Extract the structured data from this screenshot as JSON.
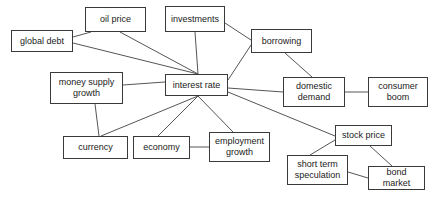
{
  "diagram": {
    "type": "node-link-diagram",
    "style": {
      "background": "#ffffff",
      "node_fill": "#ffffff",
      "node_stroke": "#3a3a3a",
      "edge_stroke": "#555555",
      "text_color": "#1a1a1a"
    },
    "nodes": [
      {
        "id": "global-debt",
        "label": "global debt",
        "x": 11,
        "y": 30,
        "w": 62,
        "h": 22
      },
      {
        "id": "oil-price",
        "label": "oil price",
        "x": 85,
        "y": 7,
        "w": 61,
        "h": 25
      },
      {
        "id": "investments",
        "label": "investments",
        "x": 165,
        "y": 6,
        "w": 60,
        "h": 26
      },
      {
        "id": "borrowing",
        "label": "borrowing",
        "x": 251,
        "y": 29,
        "w": 61,
        "h": 24
      },
      {
        "id": "money-supply-growth",
        "label": "money supply\ngrowth",
        "x": 50,
        "y": 72,
        "w": 73,
        "h": 32
      },
      {
        "id": "interest-rate",
        "label": "interest rate",
        "x": 165,
        "y": 74,
        "w": 63,
        "h": 22
      },
      {
        "id": "domestic-demand",
        "label": "domestic\ndemand",
        "x": 283,
        "y": 77,
        "w": 62,
        "h": 30
      },
      {
        "id": "consumer-boom",
        "label": "consumer\nboom",
        "x": 368,
        "y": 77,
        "w": 60,
        "h": 30
      },
      {
        "id": "currency",
        "label": "currency",
        "x": 63,
        "y": 136,
        "w": 65,
        "h": 23
      },
      {
        "id": "economy",
        "label": "economy",
        "x": 133,
        "y": 136,
        "w": 57,
        "h": 23
      },
      {
        "id": "employment-growth",
        "label": "employment\ngrowth",
        "x": 209,
        "y": 132,
        "w": 61,
        "h": 30
      },
      {
        "id": "stock-price",
        "label": "stock price",
        "x": 335,
        "y": 125,
        "w": 57,
        "h": 21
      },
      {
        "id": "short-term-speculation",
        "label": "short term\nspeculation",
        "x": 287,
        "y": 155,
        "w": 61,
        "h": 30
      },
      {
        "id": "bond-market",
        "label": "bond\nmarket",
        "x": 368,
        "y": 166,
        "w": 57,
        "h": 24
      }
    ],
    "edges": [
      {
        "from": "global-debt",
        "to": "oil-price",
        "x1": 73,
        "y1": 37,
        "x2": 91,
        "y2": 32
      },
      {
        "from": "global-debt",
        "to": "interest-rate",
        "x1": 73,
        "y1": 43,
        "x2": 198,
        "y2": 74
      },
      {
        "from": "oil-price",
        "to": "interest-rate",
        "x1": 120,
        "y1": 32,
        "x2": 198,
        "y2": 74
      },
      {
        "from": "investments",
        "to": "interest-rate",
        "x1": 195,
        "y1": 32,
        "x2": 198,
        "y2": 74
      },
      {
        "from": "investments",
        "to": "borrowing",
        "x1": 225,
        "y1": 23,
        "x2": 251,
        "y2": 40
      },
      {
        "from": "borrowing",
        "to": "interest-rate",
        "x1": 251,
        "y1": 45,
        "x2": 228,
        "y2": 80
      },
      {
        "from": "borrowing",
        "to": "domestic-demand",
        "x1": 285,
        "y1": 53,
        "x2": 312,
        "y2": 77
      },
      {
        "from": "money-supply-growth",
        "to": "interest-rate",
        "x1": 123,
        "y1": 85,
        "x2": 165,
        "y2": 82
      },
      {
        "from": "interest-rate",
        "to": "domestic-demand",
        "x1": 228,
        "y1": 88,
        "x2": 283,
        "y2": 92
      },
      {
        "from": "domestic-demand",
        "to": "consumer-boom",
        "x1": 345,
        "y1": 92,
        "x2": 368,
        "y2": 92
      },
      {
        "from": "interest-rate",
        "to": "currency",
        "x1": 198,
        "y1": 96,
        "x2": 101,
        "y2": 136
      },
      {
        "from": "money-supply-growth",
        "to": "currency",
        "x1": 95,
        "y1": 104,
        "x2": 99,
        "y2": 136
      },
      {
        "from": "interest-rate",
        "to": "economy",
        "x1": 198,
        "y1": 96,
        "x2": 158,
        "y2": 136
      },
      {
        "from": "interest-rate",
        "to": "employment-growth",
        "x1": 198,
        "y1": 96,
        "x2": 233,
        "y2": 132
      },
      {
        "from": "economy",
        "to": "employment-growth",
        "x1": 190,
        "y1": 147,
        "x2": 209,
        "y2": 147
      },
      {
        "from": "interest-rate",
        "to": "stock-price",
        "x1": 228,
        "y1": 92,
        "x2": 335,
        "y2": 136
      },
      {
        "from": "stock-price",
        "to": "short-term-speculation",
        "x1": 335,
        "y1": 140,
        "x2": 310,
        "y2": 155
      },
      {
        "from": "stock-price",
        "to": "bond-market",
        "x1": 370,
        "y1": 146,
        "x2": 392,
        "y2": 166
      },
      {
        "from": "short-term-speculation",
        "to": "bond-market",
        "x1": 348,
        "y1": 172,
        "x2": 368,
        "y2": 178
      }
    ]
  }
}
